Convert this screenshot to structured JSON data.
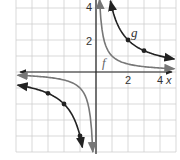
{
  "chart_data": {
    "type": "line",
    "title": "",
    "xlabel": "x",
    "ylabel": "y",
    "xlim": [
      -5,
      5
    ],
    "ylim": [
      -5,
      4.5
    ],
    "grid": true,
    "x_tick_labels": [
      "2",
      "4"
    ],
    "y_tick_labels": [
      "2",
      "4"
    ],
    "series": [
      {
        "name": "f",
        "equation": "f(x) = 1/x",
        "color": "#777777",
        "points": []
      },
      {
        "name": "g",
        "equation": "g(x) = 4/x",
        "color": "#222222",
        "points": [
          [
            1,
            4
          ],
          [
            2,
            2
          ],
          [
            3,
            1.33
          ],
          [
            -3,
            -1.33
          ],
          [
            -2,
            -2
          ],
          [
            -1,
            -4
          ]
        ]
      }
    ]
  },
  "labels": {
    "x_axis": "x",
    "y_axis": "y",
    "tick_x_2": "2",
    "tick_x_4": "4",
    "tick_y_2": "2",
    "tick_y_4": "4",
    "f_label": "f",
    "g_label": "g"
  },
  "colors": {
    "grid": "#cfcfcf",
    "axis": "#222222",
    "f": "#777777",
    "g": "#222222"
  }
}
